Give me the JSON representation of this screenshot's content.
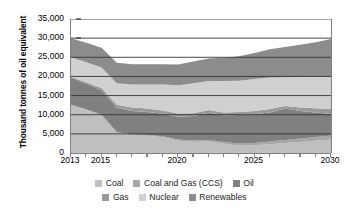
{
  "chart_data": {
    "type": "area",
    "stacked": true,
    "title": "",
    "xlabel": "",
    "ylabel": "Thousand tonnes of oil equivalent",
    "xlim": [
      2013,
      2030
    ],
    "ylim": [
      0,
      35000
    ],
    "y_tick_labels": [
      "35,000",
      "30,000",
      "25,000",
      "20,000",
      "15,000",
      "10,000",
      "5,000",
      "0"
    ],
    "y_tick_values": [
      35000,
      30000,
      25000,
      20000,
      15000,
      10000,
      5000,
      0
    ],
    "x_tick_labels": [
      "2013",
      "2015",
      "2020",
      "2025",
      "2030"
    ],
    "x_tick_values": [
      2013,
      2015,
      2020,
      2025,
      2030
    ],
    "x_minor_ticks": [
      2013,
      2014,
      2015,
      2016,
      2017,
      2018,
      2019,
      2020,
      2021,
      2022,
      2023,
      2024,
      2025,
      2026,
      2027,
      2028,
      2029,
      2030
    ],
    "grid": true,
    "grid_axis": "y",
    "legend_position": "bottom",
    "x": [
      2013,
      2014,
      2015,
      2016,
      2017,
      2018,
      2019,
      2020,
      2021,
      2022,
      2023,
      2024,
      2025,
      2026,
      2027,
      2028,
      2029,
      2030
    ],
    "series": [
      {
        "name": "Coal",
        "color": "#bfbfbf",
        "values": [
          12400,
          11200,
          9800,
          5300,
          4600,
          4500,
          4100,
          3200,
          2900,
          3000,
          2400,
          1900,
          2000,
          2300,
          2600,
          2900,
          3200,
          3500
        ]
      },
      {
        "name": "Coal and Gas (CCS)",
        "color": "#a6a6a6",
        "values": [
          200,
          200,
          200,
          200,
          200,
          200,
          250,
          300,
          350,
          400,
          450,
          500,
          600,
          700,
          800,
          900,
          1000,
          1100
        ]
      },
      {
        "name": "Oil",
        "color": "#808080",
        "values": [
          7100,
          6700,
          6400,
          6300,
          6200,
          6000,
          5900,
          6000,
          6400,
          7100,
          7000,
          7500,
          7500,
          7600,
          8200,
          7200,
          6400,
          5600
        ]
      },
      {
        "name": "Gas",
        "color": "#9a9a9a",
        "values": [
          200,
          400,
          600,
          800,
          900,
          900,
          850,
          800,
          750,
          700,
          750,
          800,
          850,
          900,
          700,
          900,
          1100,
          1300
        ]
      },
      {
        "name": "Nuclear",
        "color": "#d0d0d0",
        "values": [
          5100,
          5200,
          5300,
          5600,
          6000,
          6300,
          6800,
          7400,
          7800,
          7600,
          8200,
          8200,
          8400,
          8200,
          7500,
          8000,
          8300,
          8500
        ]
      },
      {
        "name": "Renewables",
        "color": "#8c8c8c",
        "values": [
          5000,
          5100,
          5200,
          5400,
          5300,
          5300,
          5300,
          5400,
          5700,
          5900,
          6100,
          6400,
          6800,
          7400,
          7900,
          8400,
          8900,
          9800
        ]
      }
    ],
    "totals": [
      30000,
      28800,
      27500,
      23600,
      23200,
      23200,
      23200,
      23100,
      23900,
      24700,
      24900,
      25300,
      26150,
      27100,
      27700,
      28300,
      28900,
      29800
    ],
    "legend": [
      {
        "label": "Coal",
        "color": "#bfbfbf"
      },
      {
        "label": "Coal and Gas (CCS)",
        "color": "#a6a6a6"
      },
      {
        "label": "Oil",
        "color": "#808080"
      },
      {
        "label": "Gas",
        "color": "#9a9a9a"
      },
      {
        "label": "Nuclear",
        "color": "#d0d0d0"
      },
      {
        "label": "Renewables",
        "color": "#8c8c8c"
      }
    ]
  },
  "axis": {
    "y_title": "Thousand tonnes of oil equivalent",
    "y_labels": [
      "35,000",
      "30,000",
      "25,000",
      "20,000",
      "15,000",
      "10,000",
      "5,000",
      "0"
    ],
    "x_labels": [
      "2013",
      "2015",
      "2020",
      "2025",
      "2030"
    ]
  },
  "legend": {
    "row1": [
      {
        "label": "Coal"
      },
      {
        "label": "Coal and Gas (CCS)"
      },
      {
        "label": "Oil"
      }
    ],
    "row2": [
      {
        "label": "Gas"
      },
      {
        "label": "Nuclear"
      },
      {
        "label": "Renewables"
      }
    ]
  },
  "colors": {
    "coal": "#bfbfbf",
    "coal_and_gas_ccs": "#a6a6a6",
    "oil": "#808080",
    "gas": "#9a9a9a",
    "nuclear": "#d0d0d0",
    "renewables": "#8c8c8c",
    "axis": "#808080",
    "gridline": "#333333",
    "text": "#000000"
  }
}
